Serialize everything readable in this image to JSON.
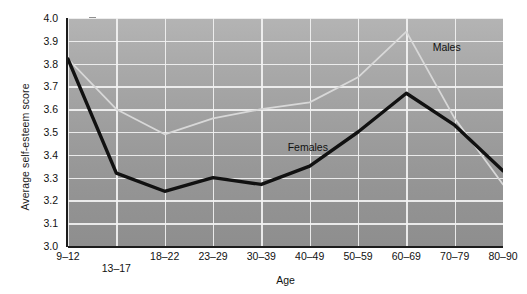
{
  "chart_data": {
    "type": "line",
    "title": "",
    "xlabel": "Age",
    "ylabel": "Average self-esteem score",
    "categories": [
      "9–12",
      "13–17",
      "18–22",
      "23–29",
      "30–39",
      "40–49",
      "50–59",
      "60–69",
      "70–79",
      "80–90"
    ],
    "ylim": [
      3.0,
      4.0
    ],
    "yticks": [
      "4.0",
      "3.9",
      "3.8",
      "3.7",
      "3.6",
      "3.5",
      "3.4",
      "3.3",
      "3.2",
      "3.1",
      "3.0"
    ],
    "ytick_values": [
      4.0,
      3.9,
      3.8,
      3.7,
      3.6,
      3.5,
      3.4,
      3.3,
      3.2,
      3.1,
      3.0
    ],
    "grid": true,
    "legend_position": "inline-annotations",
    "series": [
      {
        "name": "Males",
        "color": "#d8d8d8",
        "values": [
          3.82,
          3.6,
          3.49,
          3.56,
          3.6,
          3.63,
          3.74,
          3.94,
          3.56,
          3.27
        ]
      },
      {
        "name": "Females",
        "color": "#111111",
        "values": [
          3.82,
          3.32,
          3.24,
          3.3,
          3.27,
          3.35,
          3.5,
          3.67,
          3.53,
          3.33
        ]
      }
    ],
    "annotations": [
      {
        "text": "Males",
        "x_category": "70–79",
        "value": 3.87
      },
      {
        "text": "Females",
        "x_category": "40–49",
        "value": 3.43
      }
    ]
  }
}
